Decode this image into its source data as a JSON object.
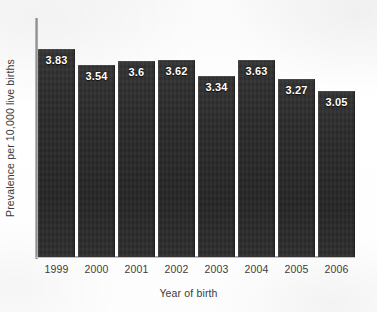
{
  "chart_data": {
    "type": "bar",
    "title": "",
    "xlabel": "Year of birth",
    "ylabel": "Prevalence per 10,000 live births",
    "categories": [
      "1999",
      "2000",
      "2001",
      "2002",
      "2003",
      "2004",
      "2005",
      "2006"
    ],
    "values": [
      3.83,
      3.54,
      3.6,
      3.62,
      3.34,
      3.63,
      3.27,
      3.05
    ],
    "value_labels": [
      "3.83",
      "3.54",
      "3.6",
      "3.62",
      "3.34",
      "3.63",
      "3.27",
      "3.05"
    ],
    "ylim": [
      0,
      4.4
    ],
    "xlim_categories": 8,
    "grid": false,
    "legend": null,
    "y_tick_labels": [],
    "bar_color": "#2b2b2b",
    "value_label_color": "#ffffff",
    "axis_color": "#8d8d8d",
    "background_color": "#fdfdfd"
  }
}
